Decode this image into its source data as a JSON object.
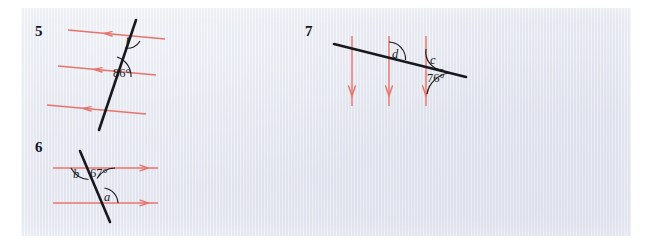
{
  "page": {
    "background_color": "#ffffff",
    "paper_color": "#e2e5ef",
    "red_color": "#e8736b",
    "black_color": "#18191f"
  },
  "problems": [
    {
      "number": "5",
      "description": "Three parallel lines cut by a transversal",
      "parallel_lines": 3,
      "arrow_direction": "left",
      "labels": [
        {
          "text": "t",
          "type": "variable"
        },
        {
          "text": "86°",
          "type": "measure",
          "value": 86
        }
      ]
    },
    {
      "number": "6",
      "description": "Two parallel lines cut by a transversal",
      "parallel_lines": 2,
      "arrow_direction": "right",
      "labels": [
        {
          "text": "b",
          "type": "variable"
        },
        {
          "text": "67°",
          "type": "measure",
          "value": 67
        },
        {
          "text": "a",
          "type": "variable"
        }
      ]
    },
    {
      "number": "7",
      "description": "Three parallel vertical lines cut by a transversal",
      "parallel_lines": 3,
      "arrow_direction": "down",
      "labels": [
        {
          "text": "d",
          "type": "variable"
        },
        {
          "text": "c",
          "type": "variable"
        },
        {
          "text": "76°",
          "type": "measure",
          "value": 76
        }
      ]
    }
  ]
}
